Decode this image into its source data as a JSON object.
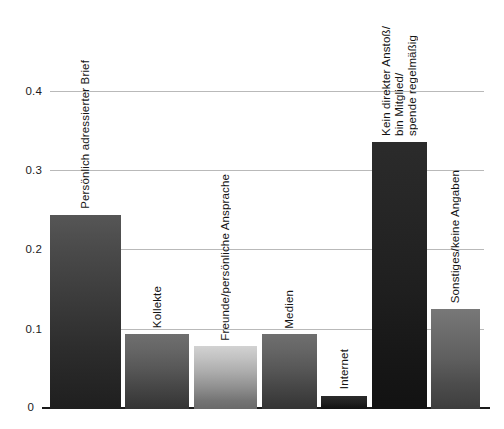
{
  "chart_data": {
    "type": "bar",
    "title": "",
    "xlabel": "",
    "ylabel": "",
    "ylim": [
      0,
      0.44
    ],
    "grid": true,
    "legend": "none",
    "categories": [
      "Persönlich adressierter Brief",
      "Kollekte",
      "Freunde/persönliche Ansprache",
      "Medien",
      "Internet",
      "Kein direkter Anstoß/\nbin Mitglied/\nspende regelmäßig",
      "Sonstiges/keine Angaben"
    ],
    "values": [
      0.245,
      0.095,
      0.079,
      0.094,
      0.017,
      0.337,
      0.126
    ],
    "ytick_labels": [
      "0",
      "0.1",
      "0.2",
      "0.3",
      "0.4"
    ],
    "ytick_values": [
      0,
      0.1,
      0.2,
      0.3,
      0.4
    ],
    "bar_tones": [
      "dark",
      "mid",
      "light",
      "mid",
      "black",
      "black",
      "mid2"
    ]
  },
  "axis": {
    "ticks": [
      {
        "label": "0.4",
        "value": 0.4
      },
      {
        "label": "0.3",
        "value": 0.3
      },
      {
        "label": "0.2",
        "value": 0.2
      },
      {
        "label": "0.1",
        "value": 0.1
      },
      {
        "label": "0",
        "value": 0
      }
    ]
  },
  "bars": [
    {
      "label": "Persönlich adressierter Brief",
      "value": 0.245,
      "tone": "tone-dark"
    },
    {
      "label": "Kollekte",
      "value": 0.095,
      "tone": "tone-mid"
    },
    {
      "label": "Freunde/persönliche Ansprache",
      "value": 0.079,
      "tone": "tone-light"
    },
    {
      "label": "Medien",
      "value": 0.094,
      "tone": "tone-mid"
    },
    {
      "label": "Internet",
      "value": 0.017,
      "tone": "tone-black"
    },
    {
      "label": "Kein direkter Anstoß/\nbin Mitglied/\nspende regelmäßig",
      "value": 0.337,
      "tone": "tone-black"
    },
    {
      "label": "Sonstiges/keine Angaben",
      "value": 0.126,
      "tone": "tone-mid2"
    }
  ],
  "colors": {
    "gridline": "#b9b9b9",
    "baseline": "#1a1a1a",
    "text": "#141414",
    "background": "#ffffff"
  }
}
